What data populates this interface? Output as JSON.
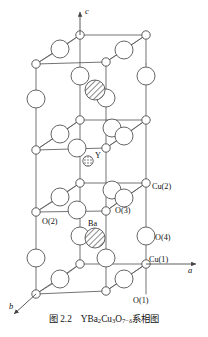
{
  "figure": {
    "caption_number": "图 2.2",
    "caption_formula_parts": [
      {
        "t": "YBa",
        "sub": false
      },
      {
        "t": "2",
        "sub": true
      },
      {
        "t": "Cu",
        "sub": false
      },
      {
        "t": "3",
        "sub": true
      },
      {
        "t": "O",
        "sub": false
      },
      {
        "t": "7−δ",
        "sub": true
      }
    ],
    "caption_text": "系相图",
    "caption_full": "图 2.2   YBa2Cu3O7−δ系相图"
  },
  "axes": [
    {
      "name": "c-axis",
      "label": "c",
      "direction": "up",
      "x": 62,
      "y": 10
    },
    {
      "name": "a-axis",
      "label": "a",
      "direction": "right",
      "x": 191,
      "y": 284
    },
    {
      "name": "b-axis",
      "label": "b",
      "direction": "lower-left",
      "x": 11,
      "y": 302
    }
  ],
  "atom_labels": [
    {
      "id": "cu2",
      "text": "Cu(2)",
      "x": 152,
      "y": 189
    },
    {
      "id": "o3",
      "text": "O(3)",
      "x": 115,
      "y": 212
    },
    {
      "id": "o2",
      "text": "O(2)",
      "x": 42,
      "y": 222
    },
    {
      "id": "ba",
      "text": "Ba",
      "x": 90,
      "y": 224
    },
    {
      "id": "o4",
      "text": "O(4)",
      "x": 152,
      "y": 234
    },
    {
      "id": "cu1",
      "text": "Cu(1)",
      "x": 149,
      "y": 262
    },
    {
      "id": "o1",
      "text": "O(1)",
      "x": 133,
      "y": 303
    },
    {
      "id": "y",
      "text": "Y",
      "x": 94,
      "y": 155
    }
  ],
  "legend": {
    "small_open_circle": "Cu atom",
    "large_open_circle": "O atom",
    "hatched_circle": "Ba atom",
    "stippled_small_circle": "Y atom"
  },
  "colors": {
    "line": "#5a5a5a",
    "outline": "#444444",
    "fill_open": "#ffffff",
    "hatch": "#777777",
    "text": "#111111",
    "background": "#ffffff"
  }
}
